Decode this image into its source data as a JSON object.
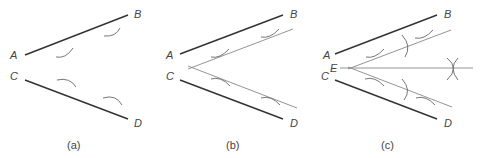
{
  "figure": {
    "panels": [
      {
        "id": "a",
        "caption": "(a)",
        "labels": {
          "A": "A",
          "B": "B",
          "C": "C",
          "D": "D"
        }
      },
      {
        "id": "b",
        "caption": "(b)",
        "labels": {
          "A": "A",
          "B": "B",
          "C": "C",
          "D": "D"
        }
      },
      {
        "id": "c",
        "caption": "(c)",
        "labels": {
          "A": "A",
          "B": "B",
          "C": "C",
          "D": "D",
          "E": "E"
        }
      }
    ]
  }
}
